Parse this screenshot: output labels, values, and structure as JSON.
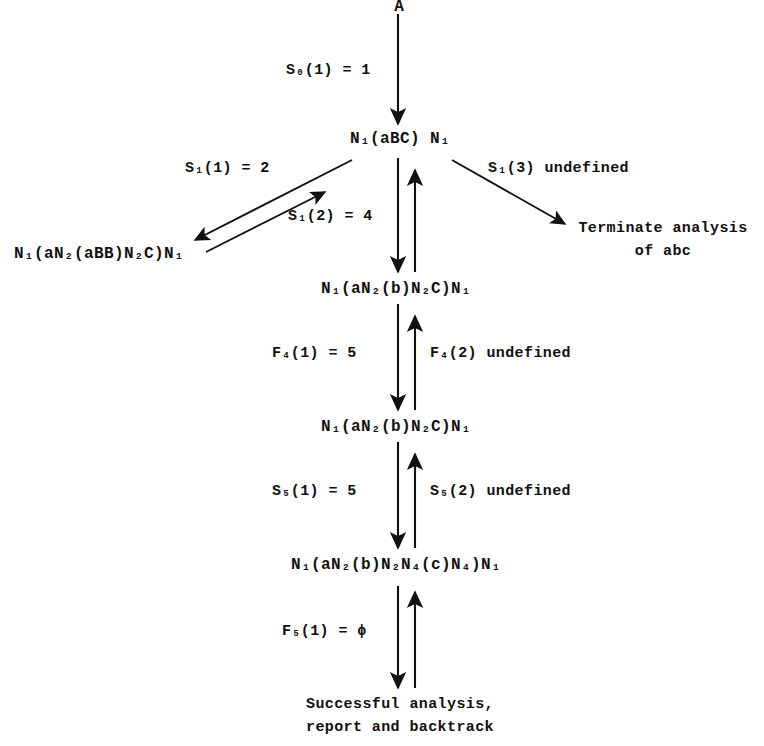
{
  "diagram": {
    "root": {
      "label": "A"
    },
    "nodes": [
      {
        "id": "n-abc",
        "text": "N₁(aBC) N₁"
      },
      {
        "id": "n-abb",
        "text": "N₁(aN₂(aBB)N₂C)N₁"
      },
      {
        "id": "n-b-1",
        "text": "N₁(aN₂(b)N₂C)N₁"
      },
      {
        "id": "n-b-2",
        "text": "N₁(aN₂(b)N₂C)N₁"
      },
      {
        "id": "n-c",
        "text": "N₁(aN₂(b)N₂N₄(c)N₄)N₁"
      }
    ],
    "edge_labels": [
      {
        "id": "e-s0-1",
        "text": "S₀(1) = 1"
      },
      {
        "id": "e-s1-1",
        "text": "S₁(1) = 2"
      },
      {
        "id": "e-s1-2",
        "text": "S₁(2) = 4"
      },
      {
        "id": "e-s1-3",
        "text": "S₁(3) undefined"
      },
      {
        "id": "e-f4-1",
        "text": "F₄(1) = 5"
      },
      {
        "id": "e-f4-2",
        "text": "F₄(2) undefined"
      },
      {
        "id": "e-s5-1",
        "text": "S₅(1) = 5"
      },
      {
        "id": "e-s5-2",
        "text": "S₅(2) undefined"
      },
      {
        "id": "e-f5-1",
        "text": "F₅(1) = ϕ"
      }
    ],
    "terminals": [
      {
        "id": "t-terminate",
        "line1": "Terminate analysis",
        "line2": "of abc"
      },
      {
        "id": "t-success",
        "line1": "Successful analysis,",
        "line2": "report and backtrack"
      }
    ],
    "colors": {
      "ink": "#111111",
      "background": "#ffffff"
    }
  }
}
